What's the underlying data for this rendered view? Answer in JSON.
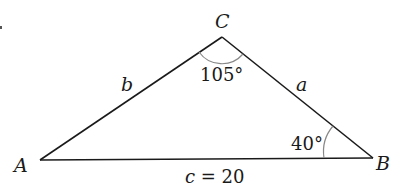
{
  "diagram": {
    "type": "triangle",
    "vertices": {
      "A": {
        "label": "A"
      },
      "B": {
        "label": "B"
      },
      "C": {
        "label": "C"
      }
    },
    "sides": {
      "a": {
        "label": "a"
      },
      "b": {
        "label": "b"
      },
      "c": {
        "label": "c = 20"
      }
    },
    "angles": {
      "C": {
        "label": "105°"
      },
      "B": {
        "label": "40°"
      }
    },
    "colors": {
      "stroke": "#1a1a1a",
      "arc": "#888888"
    }
  }
}
